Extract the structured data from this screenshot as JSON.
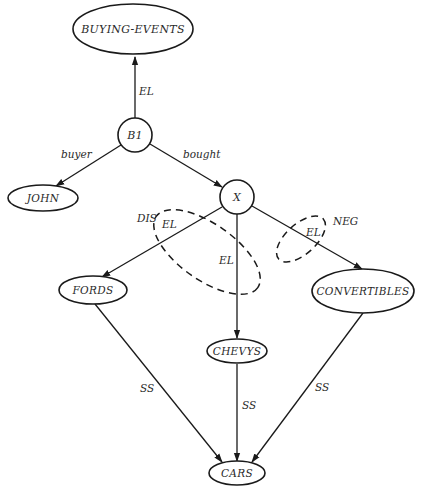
{
  "diagram": {
    "type": "semantic-network",
    "nodes": {
      "buying_events": {
        "label": "BUYING-EVENTS",
        "shape": "ellipse"
      },
      "b1": {
        "label": "B1",
        "shape": "circle"
      },
      "john": {
        "label": "JOHN",
        "shape": "ellipse"
      },
      "x": {
        "label": "X",
        "shape": "circle"
      },
      "fords": {
        "label": "FORDS",
        "shape": "ellipse"
      },
      "chevys": {
        "label": "CHEVYS",
        "shape": "ellipse"
      },
      "convertibles": {
        "label": "CONVERTIBLES",
        "shape": "ellipse"
      },
      "cars": {
        "label": "CARS",
        "shape": "ellipse"
      }
    },
    "edges": [
      {
        "from": "B1",
        "to": "BUYING-EVENTS",
        "label": "EL"
      },
      {
        "from": "B1",
        "to": "JOHN",
        "label": "buyer"
      },
      {
        "from": "B1",
        "to": "X",
        "label": "bought"
      },
      {
        "from": "X",
        "to": "FORDS",
        "label": ""
      },
      {
        "from": "X",
        "to": "CHEVYS",
        "label": ""
      },
      {
        "from": "X",
        "to": "CONVERTIBLES",
        "label": ""
      },
      {
        "from": "FORDS",
        "to": "CARS",
        "label": "SS"
      },
      {
        "from": "CHEVYS",
        "to": "CARS",
        "label": "SS"
      },
      {
        "from": "CONVERTIBLES",
        "to": "CARS",
        "label": "SS"
      }
    ],
    "edge_labels": {
      "b1_buying_events": "EL",
      "buyer": "buyer",
      "bought": "bought",
      "fords_cars": "SS",
      "chevys_cars": "SS",
      "convertibles_cars": "SS"
    },
    "partitions": {
      "disjunction": {
        "label": "DIS",
        "inner_labels": [
          "EL",
          "EL"
        ]
      },
      "negation": {
        "label": "NEG",
        "inner_labels": [
          "EL"
        ]
      }
    }
  }
}
